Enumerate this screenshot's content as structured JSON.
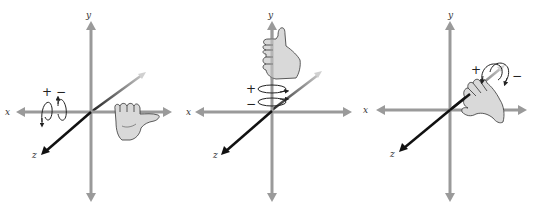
{
  "diagram": {
    "colors": {
      "axis": "#9a9a9a",
      "z_axis_near": "#111111",
      "z_axis_far": "#c8c8c8",
      "hand_fill": "#d9d9d9",
      "hand_stroke": "#333333",
      "text": "#333333"
    },
    "panels": [
      {
        "id": "x-rotation",
        "axis_labels": {
          "x": "x",
          "y": "y",
          "z": "z"
        },
        "rotation_axis": "x",
        "plus_label": "+",
        "minus_label": "−"
      },
      {
        "id": "y-rotation",
        "axis_labels": {
          "x": "x",
          "y": "y",
          "z": "z"
        },
        "rotation_axis": "y",
        "plus_label": "+",
        "minus_label": "−"
      },
      {
        "id": "z-rotation",
        "axis_labels": {
          "x": "x",
          "y": "y",
          "z": "z"
        },
        "rotation_axis": "z",
        "plus_label": "+",
        "minus_label": "−"
      }
    ]
  }
}
